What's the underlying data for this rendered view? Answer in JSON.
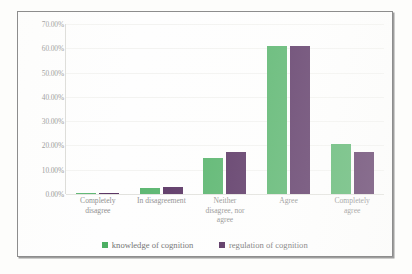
{
  "chart_data": {
    "type": "bar",
    "title": "",
    "xlabel": "",
    "ylabel": "",
    "ylim": [
      0,
      70
    ],
    "grid": true,
    "legend_position": "bottom-center",
    "categories": [
      "Completely disagree",
      "In disagreement",
      "Neither disagree, nor agree",
      "Agree",
      "Completely agree"
    ],
    "category_lines": [
      [
        "Completely",
        "disagree"
      ],
      [
        "In disagreement"
      ],
      [
        "Neither",
        "disagree, nor",
        "agree"
      ],
      [
        "Agree"
      ],
      [
        "Completely",
        "agree"
      ]
    ],
    "ytick_labels": [
      "70.00%",
      "60.00%",
      "50.00%",
      "40.00%",
      "30.00%",
      "20.00%",
      "10.00%",
      "0.00%"
    ],
    "ytick_values": [
      70,
      60,
      50,
      40,
      30,
      20,
      10,
      0
    ],
    "series": [
      {
        "name": "knowledge of cognition",
        "color": "#4caf63",
        "values": [
          0.5,
          2.5,
          15.0,
          61.0,
          20.5
        ]
      },
      {
        "name": "regulation of cognition",
        "color": "#4f2759",
        "values": [
          0.5,
          3.0,
          17.5,
          61.0,
          17.5
        ]
      }
    ]
  }
}
